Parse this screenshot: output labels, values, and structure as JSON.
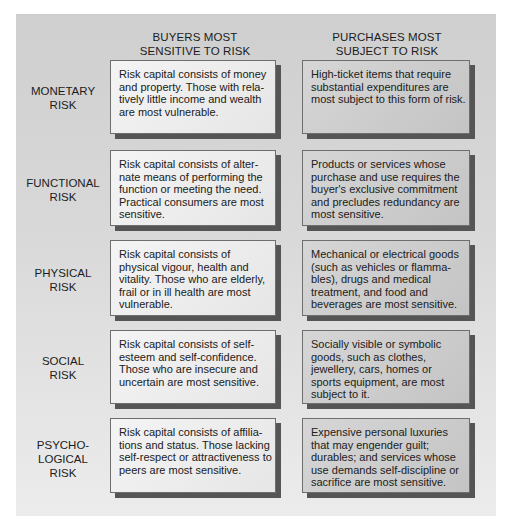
{
  "headers": {
    "buyers": [
      "BUYERS MOST",
      "SENSITIVE TO RISK"
    ],
    "purchases": [
      "PURCHASES MOST",
      "SUBJECT TO RISK"
    ]
  },
  "rows": [
    {
      "label": [
        "MONETARY",
        "RISK"
      ],
      "buyers": [
        "Risk capital consists of money",
        "and property. Those with rela-",
        "tively little income and wealth",
        "are most vulnerable."
      ],
      "purchases": [
        "High-ticket items that require",
        "substantial expenditures are",
        "most subject to this form of risk."
      ]
    },
    {
      "label": [
        "FUNCTIONAL",
        "RISK"
      ],
      "buyers": [
        "Risk capital consists of alter-",
        "nate means of performing the",
        "function or meeting the need.",
        "Practical consumers are most",
        "sensitive."
      ],
      "purchases": [
        "Products or services whose",
        "purchase and use requires the",
        "buyer's exclusive commitment",
        "and precludes redundancy are",
        "most sensitive."
      ]
    },
    {
      "label": [
        "PHYSICAL",
        "RISK"
      ],
      "buyers": [
        "Risk capital consists of",
        "physical vigour, health and",
        "vitality. Those who are elderly,",
        "frail or in ill health are most",
        "vulnerable."
      ],
      "purchases": [
        "Mechanical or electrical goods",
        "(such as vehicles or flamma-",
        "bles), drugs and medical",
        "treatment, and food and",
        "beverages are most sensitive."
      ]
    },
    {
      "label": [
        "SOCIAL",
        "RISK"
      ],
      "buyers": [
        "Risk capital consists of self-",
        "esteem and self-confidence.",
        "Those who are insecure and",
        "uncertain are most sensitive."
      ],
      "purchases": [
        "Socially visible or symbolic",
        "goods, such as clothes,",
        "jewellery, cars, homes or",
        "sports equipment, are most",
        "subject to it."
      ]
    },
    {
      "label": [
        "PSYCHO-",
        "LOGICAL",
        "RISK"
      ],
      "buyers": [
        "Risk capital consists of affilia-",
        "tions and status. Those lacking",
        "self-respect or attractiveness to",
        "peers are most sensitive."
      ],
      "purchases": [
        "Expensive personal luxuries",
        "that may engender guilt;",
        "durables; and services whose",
        "use demands self-discipline or",
        "sacrifice are most sensitive."
      ]
    }
  ]
}
